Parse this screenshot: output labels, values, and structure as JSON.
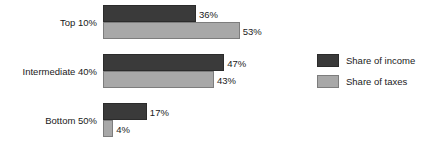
{
  "chart_data": {
    "type": "bar",
    "orientation": "horizontal",
    "title": "",
    "xlabel": "",
    "ylabel": "",
    "grid": false,
    "xlim": [
      0,
      60
    ],
    "legend_position": "right",
    "categories": [
      "Top 10%",
      "Intermediate 40%",
      "Bottom 50%"
    ],
    "series": [
      {
        "name": "Share of income",
        "color": "#3a3a3a",
        "values": [
          36,
          47,
          17
        ],
        "labels": [
          "36%",
          "47%",
          "17%"
        ]
      },
      {
        "name": "Share of taxes",
        "color": "#a8a8a8",
        "values": [
          53,
          43,
          4
        ],
        "labels": [
          "53%",
          "43%",
          "4%"
        ]
      }
    ]
  },
  "plot": {
    "groups": [
      {
        "category": "Top 10%",
        "bars": [
          {
            "series": "Share of income",
            "value": 36,
            "label": "36%"
          },
          {
            "series": "Share of taxes",
            "value": 53,
            "label": "53%"
          }
        ]
      },
      {
        "category": "Intermediate 40%",
        "bars": [
          {
            "series": "Share of income",
            "value": 47,
            "label": "47%"
          },
          {
            "series": "Share of taxes",
            "value": 43,
            "label": "43%"
          }
        ]
      },
      {
        "category": "Bottom 50%",
        "bars": [
          {
            "series": "Share of income",
            "value": 17,
            "label": "17%"
          },
          {
            "series": "Share of taxes",
            "value": 4,
            "label": "4%"
          }
        ]
      }
    ]
  },
  "legend": {
    "items": [
      {
        "label": "Share of income",
        "color": "#3a3a3a"
      },
      {
        "label": "Share of taxes",
        "color": "#a8a8a8"
      }
    ]
  },
  "scale": {
    "px_per_percent": 2.58,
    "origin_x": 103
  }
}
